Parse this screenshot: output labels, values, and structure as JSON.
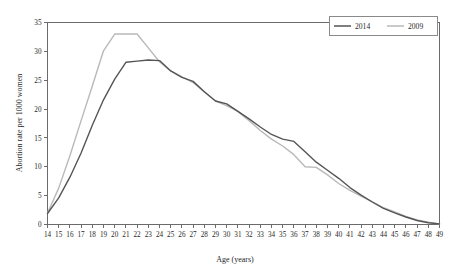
{
  "chart_data": {
    "type": "line",
    "title": "",
    "xlabel": "Age (years)",
    "ylabel": "Abortion rate per 1000 women",
    "xlim": [
      14,
      49
    ],
    "ylim": [
      0,
      35
    ],
    "grid": false,
    "legend_position": "top-right",
    "x": [
      14,
      15,
      16,
      17,
      18,
      19,
      20,
      21,
      22,
      23,
      24,
      25,
      26,
      27,
      28,
      29,
      30,
      31,
      32,
      33,
      34,
      35,
      36,
      37,
      38,
      39,
      40,
      41,
      42,
      43,
      44,
      45,
      46,
      47,
      48,
      49
    ],
    "xticklabels": [
      "14",
      "15",
      "16",
      "17",
      "18",
      "19",
      "20",
      "21",
      "22",
      "23",
      "24",
      "25",
      "26",
      "27",
      "28",
      "29",
      "30",
      "31",
      "32",
      "33",
      "34",
      "35",
      "36",
      "37",
      "38",
      "39",
      "40",
      "41",
      "42",
      "43",
      "44",
      "45",
      "46",
      "47",
      "48",
      "49"
    ],
    "yticks": [
      0,
      5,
      10,
      15,
      20,
      25,
      30,
      35
    ],
    "yticklabels": [
      "0",
      "5",
      "10",
      "15",
      "20",
      "25",
      "30",
      "35"
    ],
    "series": [
      {
        "name": "2014",
        "color": "#555555",
        "values": [
          1.9,
          4.6,
          8.2,
          12.4,
          17.2,
          21.6,
          25.2,
          28.1,
          28.3,
          28.5,
          28.4,
          26.6,
          25.5,
          24.8,
          23.0,
          21.4,
          20.9,
          19.6,
          18.3,
          16.9,
          15.6,
          14.8,
          14.4,
          12.6,
          10.8,
          9.4,
          8.0,
          6.4,
          5.1,
          3.9,
          2.8,
          2.0,
          1.3,
          0.7,
          0.3,
          0.1
        ]
      },
      {
        "name": "2009",
        "color": "#b9b9b9",
        "values": [
          2.0,
          6.3,
          11.9,
          18.0,
          24.0,
          30.1,
          33.0,
          33.0,
          33.0,
          30.6,
          28.2,
          26.6,
          25.6,
          24.6,
          23.0,
          21.4,
          20.6,
          19.6,
          18.0,
          16.3,
          14.8,
          13.6,
          12.1,
          10.0,
          9.9,
          8.6,
          7.1,
          5.9,
          4.9,
          3.9,
          2.9,
          2.2,
          1.4,
          0.8,
          0.4,
          0.1
        ]
      }
    ],
    "legend": [
      {
        "label": "2014",
        "color": "#555555"
      },
      {
        "label": "2009",
        "color": "#b9b9b9"
      }
    ]
  }
}
